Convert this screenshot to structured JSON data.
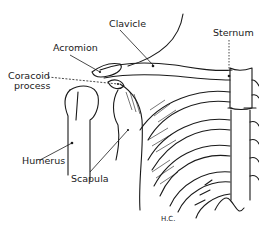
{
  "figure": {
    "labels": {
      "clavicle": "Clavicle",
      "sternum": "Sternum",
      "acromion": "Acromion",
      "coracoid_line1": "Coracoid",
      "coracoid_line2": "process",
      "humerus": "Humerus",
      "scapula": "Scapula"
    },
    "signature": "H.C."
  }
}
